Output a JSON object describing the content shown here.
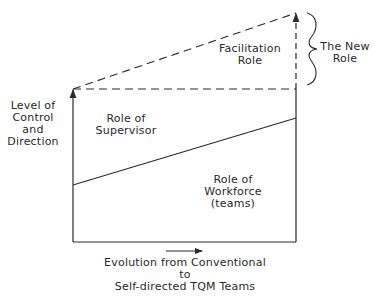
{
  "diagram": {
    "y_axis_label": [
      "Level of",
      "Control",
      "and",
      "Direction"
    ],
    "x_axis_label": [
      "Evolution from Conventional",
      "to",
      "Self-directed TQM Teams"
    ],
    "regions": {
      "facilitation": [
        "Facilitation",
        "Role"
      ],
      "supervisor": [
        "Role of",
        "Supervisor"
      ],
      "workforce": [
        "Role of",
        "Workforce",
        "(teams)"
      ]
    },
    "brace_label": [
      "The New",
      "Role"
    ],
    "colors": {
      "line": "#2a2a2a",
      "background": "#ffffff"
    }
  }
}
